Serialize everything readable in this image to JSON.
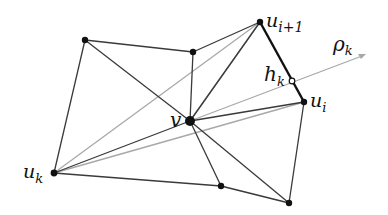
{
  "diagram": {
    "type": "planar-triangulation",
    "colors": {
      "edge": "#3a3a3a",
      "bold_edge": "#111111",
      "gray_edge": "#a8a8a8",
      "node": "#111111",
      "background": "#ffffff"
    },
    "labels": {
      "v": "v",
      "u_i1_base": "u",
      "u_i1_sub": "i+1",
      "u_i_base": "u",
      "u_i_sub": "i",
      "u_k_base": "u",
      "u_k_sub": "k",
      "h_k_base": "h",
      "h_k_sub": "k",
      "rho_k_base": "ρ",
      "rho_k_sub": "k"
    },
    "nodes": [
      {
        "id": "n_topleft",
        "x": 85,
        "y": 40
      },
      {
        "id": "n_topmid",
        "x": 193,
        "y": 52
      },
      {
        "id": "u_i1",
        "x": 260,
        "y": 22
      },
      {
        "id": "u_i",
        "x": 304,
        "y": 102
      },
      {
        "id": "v",
        "x": 190,
        "y": 121
      },
      {
        "id": "u_k",
        "x": 54,
        "y": 173
      },
      {
        "id": "n_bot1",
        "x": 221,
        "y": 186
      },
      {
        "id": "n_bot2",
        "x": 289,
        "y": 203
      },
      {
        "id": "h_k",
        "x": 292,
        "y": 81,
        "hollow": true
      }
    ]
  }
}
